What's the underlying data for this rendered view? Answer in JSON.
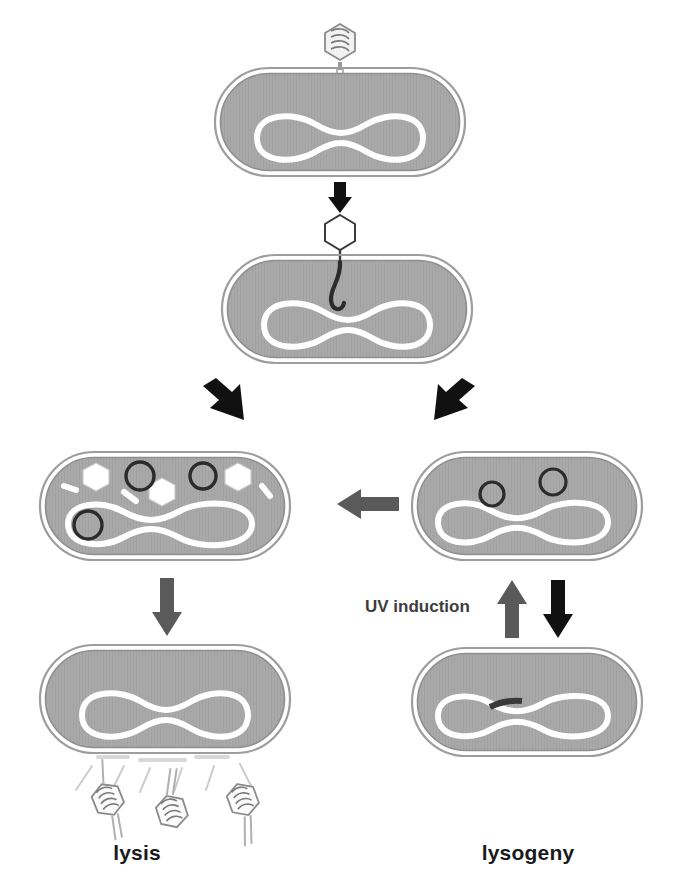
{
  "figure": {
    "background_color": "#ffffff"
  },
  "palette": {
    "cell_wall_stroke": "#9a9a9a",
    "cytoplasm_fill": "#a9a9a9",
    "nucleoid_fill": "#a9a9a9",
    "chromosome_stroke": "#ffffff",
    "capsid_fill_white": "#ffffff",
    "capsid_stroke": "#4a4a4a",
    "dna_dark": "#2b2b2b",
    "arrow_black": "#111111",
    "arrow_gray": "#5a5a5a",
    "prophage_dark": "#3a3a3a",
    "text_black": "#1a1a1a",
    "text_gray": "#3d3d3d"
  },
  "labels": {
    "lysis": "lysis",
    "lysogeny": "lysogeny",
    "uv_induction": "UV induction"
  },
  "stages": [
    {
      "id": "attachment",
      "name": "phage-attached-to-cell",
      "description": "Bacteriophage adsorbed on bacterial cell surface",
      "cell": {
        "x": 215,
        "y": 68,
        "width": 250,
        "height": 108
      },
      "phage": {
        "x": 340,
        "y": 44,
        "state": "filled-dna"
      }
    },
    {
      "id": "injection",
      "name": "dna-injection",
      "description": "Empty capsid injecting phage DNA into the cell",
      "cell": {
        "x": 222,
        "y": 255,
        "width": 250,
        "height": 108
      },
      "phage": {
        "x": 340,
        "y": 232,
        "state": "empty-capsid"
      }
    },
    {
      "id": "assembly",
      "name": "phage-assembly",
      "description": "Progeny phage components assembling in cytoplasm",
      "cell": {
        "x": 40,
        "y": 452,
        "width": 250,
        "height": 108
      },
      "components": {
        "capsids": 4,
        "dna_circles": 4,
        "tail_rods": 4
      }
    },
    {
      "id": "lysogenic-cell",
      "name": "lysogenic-conversion",
      "description": "Circular phage DNA present in the cytoplasm",
      "cell": {
        "x": 412,
        "y": 452,
        "width": 230,
        "height": 108
      },
      "components": {
        "dna_circles": 2
      }
    },
    {
      "id": "lysis",
      "name": "cell-lysis",
      "description": "Cell bursting and releasing progeny phage particles",
      "cell": {
        "x": 40,
        "y": 645,
        "width": 250,
        "height": 108
      },
      "released_phages": 3
    },
    {
      "id": "prophage",
      "name": "prophage-integrated",
      "description": "Phage genome integrated into host chromosome as prophage",
      "cell": {
        "x": 412,
        "y": 648,
        "width": 230,
        "height": 108
      },
      "prophage_segment": true
    }
  ],
  "arrows": [
    {
      "id": "a1",
      "name": "arrow-attachment-to-injection",
      "style": "black",
      "direction": "down"
    },
    {
      "id": "a2",
      "name": "arrow-branch-to-lytic",
      "style": "black",
      "direction": "down-left"
    },
    {
      "id": "a3",
      "name": "arrow-branch-to-lysogenic",
      "style": "black",
      "direction": "down-right"
    },
    {
      "id": "a4",
      "name": "arrow-induction-to-assembly",
      "style": "gray",
      "direction": "left"
    },
    {
      "id": "a5",
      "name": "arrow-assembly-to-lysis",
      "style": "gray",
      "direction": "down"
    },
    {
      "id": "a6",
      "name": "arrow-uv-induction-up",
      "style": "gray",
      "direction": "up"
    },
    {
      "id": "a7",
      "name": "arrow-to-lysogeny",
      "style": "black",
      "direction": "down"
    }
  ]
}
